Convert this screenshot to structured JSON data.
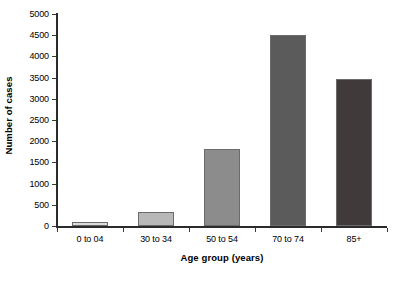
{
  "chart_data": {
    "type": "bar",
    "title": "",
    "subtitle": "",
    "xlabel": "Age group (years)",
    "ylabel": "Number of cases",
    "categories": [
      "0 to 04",
      "30 to 34",
      "50 to 54",
      "70 to 74",
      "85+"
    ],
    "values": [
      90,
      330,
      1810,
      4500,
      3470
    ],
    "series": [
      {
        "name": "Number of cases",
        "values": [
          90,
          330,
          1810,
          4500,
          3470
        ]
      }
    ],
    "ylim": [
      0,
      5000
    ],
    "ytick_values": [
      0,
      500,
      1000,
      1500,
      2000,
      2500,
      3000,
      3500,
      4000,
      4500,
      5000
    ],
    "ytick_labels": [
      "0",
      "500",
      "1000",
      "1500",
      "2000",
      "2500",
      "3000",
      "3500",
      "4000",
      "4500",
      "5000"
    ],
    "grid": false,
    "legend": "none",
    "annotations": [],
    "bar_colors": [
      "#DCDCDC",
      "#B8B8B8",
      "#8C8C8C",
      "#5B5B5B",
      "#403A3A"
    ],
    "bar_edge_color": "#6B6B6B",
    "axis_color": "#2B2B2B"
  }
}
